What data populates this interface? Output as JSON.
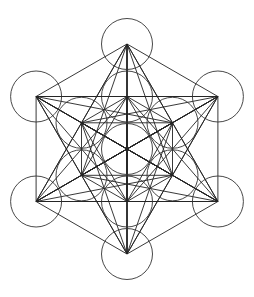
{
  "figure": {
    "background": "#ffffff",
    "stroke_color": "#222222",
    "center": [
      127,
      149
    ],
    "outer_radius": 105,
    "inner_radius": 52.5,
    "circle_radius": 25.5,
    "circle_count": 13
  }
}
